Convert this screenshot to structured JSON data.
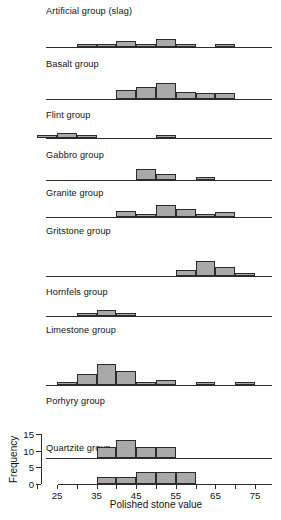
{
  "chart_data": {
    "type": "bar",
    "title": "",
    "subtitle": "",
    "xlabel": "Polished stone value",
    "ylabel": "Frequency",
    "xlim": [
      15,
      77
    ],
    "ylim": [
      0,
      15
    ],
    "grid": false,
    "legend": "none",
    "bin_width": 5,
    "xticks": [
      20,
      25,
      30,
      35,
      40,
      45,
      50,
      55,
      60,
      65,
      70,
      75
    ],
    "xtick_labels": [
      "",
      "25",
      "",
      "35",
      "",
      "45",
      "",
      "55",
      "",
      "65",
      "",
      "75"
    ],
    "yticks": [
      0,
      5,
      10,
      15
    ],
    "ytick_labels": [
      "0",
      "5",
      "10",
      "15"
    ],
    "panels": [
      {
        "label": "Artificial group (slag)",
        "bins": [
          30,
          35,
          40,
          45,
          50,
          55,
          65
        ],
        "values": [
          2,
          2,
          4,
          2,
          5,
          2,
          2
        ]
      },
      {
        "label": "Basalt group",
        "bins": [
          40,
          45,
          50,
          55,
          60,
          65
        ],
        "values": [
          6,
          8,
          11,
          5,
          4,
          4
        ]
      },
      {
        "label": "Flint group",
        "bins": [
          20,
          25,
          30,
          50
        ],
        "values": [
          2,
          3,
          2,
          2
        ]
      },
      {
        "label": "Gabbro group",
        "bins": [
          45,
          50,
          60
        ],
        "values": [
          7,
          4,
          2
        ]
      },
      {
        "label": "Granite group",
        "bins": [
          40,
          45,
          50,
          55,
          60,
          65
        ],
        "values": [
          4,
          1,
          8,
          5,
          2,
          3
        ]
      },
      {
        "label": "Gritstone group",
        "bins": [
          55,
          60,
          65,
          70
        ],
        "values": [
          4,
          10,
          6,
          2
        ]
      },
      {
        "label": "Hornfels group",
        "bins": [
          30,
          35,
          40
        ],
        "values": [
          2,
          4,
          2
        ]
      },
      {
        "label": "Limestone group",
        "bins": [
          25,
          30,
          35,
          40,
          45,
          50,
          60,
          70
        ],
        "values": [
          2,
          7,
          13,
          9,
          1,
          3,
          2,
          2
        ]
      },
      {
        "label": "Porhyry group",
        "bins": [
          35,
          40,
          45,
          50
        ],
        "values": [
          14,
          22,
          13,
          14
        ]
      },
      {
        "label": "Quartzite group",
        "bins": [
          35,
          40,
          45,
          50,
          55
        ],
        "values": [
          2,
          2,
          3.5,
          3.5,
          3.5
        ]
      }
    ]
  }
}
